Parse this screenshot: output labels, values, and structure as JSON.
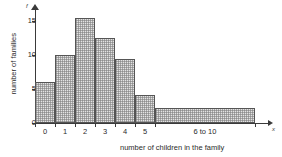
{
  "chart_data": {
    "type": "bar",
    "title": "",
    "subtitle": "",
    "xlabel": "number of children in the family",
    "ylabel": "number of families",
    "x_axis_symbol": "x",
    "y_axis_symbol": "f",
    "categories": [
      "0",
      "1",
      "2",
      "3",
      "4",
      "5",
      "6 to 10"
    ],
    "values": [
      6,
      10,
      15.5,
      12.5,
      9.5,
      4.2,
      2.2
    ],
    "bar_widths": [
      1,
      1,
      1,
      1,
      1,
      1,
      5
    ],
    "ylim": [
      0,
      16
    ],
    "yticks": [
      0,
      5,
      10,
      15
    ],
    "ytick_labels": [
      "0",
      "5",
      "10",
      "15"
    ],
    "xticks": [
      "0",
      "1",
      "2",
      "3",
      "4",
      "5",
      "6 to 10"
    ],
    "grid": false,
    "legend": "none",
    "colors": {
      "bar_fill": "#e3e3e3",
      "bar_hatch": "#787878",
      "bar_edge": "#555555",
      "axis": "#3a3a3a",
      "text": "#2b2b2b",
      "background": "#ffffff"
    }
  }
}
